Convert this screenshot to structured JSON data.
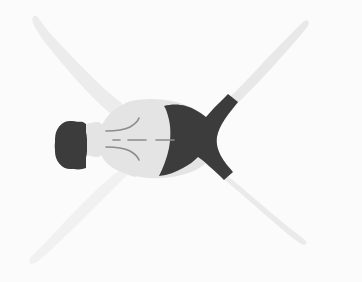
{
  "image": {
    "title": "Prone human figure viewed from above",
    "description": "Illustration of a person lying face-down with arms and legs spread in an X shape",
    "width": 362,
    "height": 282,
    "orientation": "head-left-feet-right"
  },
  "colors": {
    "background": "#fbfbfb",
    "body_light": "#e6e6e6",
    "limb_light": "#ececec",
    "limb_lightest": "#f1f1f1",
    "torso": "#e4e4e4",
    "dark": "#3c3c3c",
    "line": "#8c8c8c",
    "shade": "#dddddd"
  },
  "parts": {
    "head": {
      "name": "head",
      "color": "#3c3c3c",
      "note": "dark rounded head at far left"
    },
    "neck": {
      "name": "neck",
      "color": "#e4e4e4"
    },
    "torso": {
      "name": "torso",
      "color": "#e4e4e4",
      "note": "light grey back of torso"
    },
    "shorts": {
      "name": "shorts",
      "color": "#3c3c3c",
      "note": "dark shorts over pelvis and hips"
    },
    "arm_upper_left": {
      "name": "left-arm",
      "color": "#ececec",
      "direction": "up-left"
    },
    "arm_lower_left": {
      "name": "right-arm",
      "color": "#f1f1f1",
      "direction": "down-left"
    },
    "leg_upper_right": {
      "name": "left-leg",
      "color": "#e8e8e8",
      "direction": "up-right"
    },
    "leg_lower_right": {
      "name": "right-leg",
      "color": "#eaeaea",
      "direction": "down-right"
    },
    "spine_marks": {
      "name": "spine-dashes",
      "color": "#8c8c8c",
      "dash_count": 3
    },
    "shoulder_marks": {
      "name": "shoulder-creases",
      "color": "#8c8c8c",
      "curve_count": 2
    }
  }
}
